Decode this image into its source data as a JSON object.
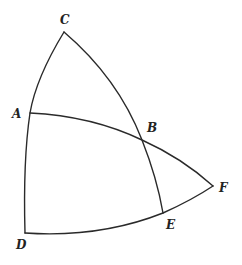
{
  "diagram": {
    "type": "spherical-geometry",
    "points": [
      {
        "id": "C",
        "label": "C",
        "x": 64,
        "y": 32
      },
      {
        "id": "A",
        "label": "A",
        "x": 30,
        "y": 113
      },
      {
        "id": "B",
        "label": "B",
        "x": 142,
        "y": 140
      },
      {
        "id": "F",
        "label": "F",
        "x": 213,
        "y": 186
      },
      {
        "id": "E",
        "label": "E",
        "x": 163,
        "y": 213
      },
      {
        "id": "D",
        "label": "D",
        "x": 25,
        "y": 233
      }
    ],
    "arcs": [
      {
        "from": "C",
        "to": "D",
        "through": "A"
      },
      {
        "from": "C",
        "to": "E",
        "through": "B"
      },
      {
        "from": "A",
        "to": "F",
        "through": "B"
      },
      {
        "from": "D",
        "to": "F",
        "through": "E"
      }
    ],
    "labels": {
      "C": "C",
      "A": "A",
      "B": "B",
      "F": "F",
      "E": "E",
      "D": "D"
    },
    "stroke_color": "#2a2a2a"
  }
}
